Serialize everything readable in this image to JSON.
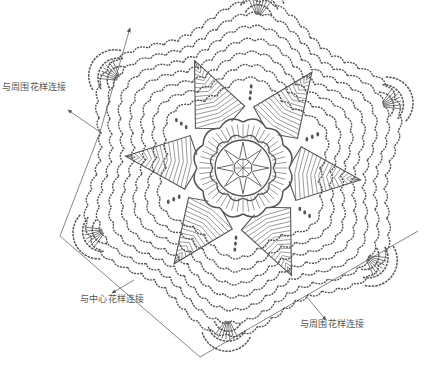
{
  "diagram": {
    "type": "crochet-chart",
    "center": {
      "x": 243,
      "y": 168
    },
    "segments": 6,
    "colors": {
      "stroke": "#555555",
      "line": "#777777",
      "background": "#ffffff"
    }
  },
  "annotations": [
    {
      "id": "top-left",
      "text": "与周围花样连接",
      "x": 2,
      "y": 86,
      "arrow_from": [
        100,
        132
      ],
      "arrow_to": [
        68,
        110
      ]
    },
    {
      "id": "bottom-left",
      "text": "与中心花样连接",
      "x": 80,
      "y": 297,
      "arrow_from": [
        134,
        280
      ],
      "arrow_to": [
        112,
        293
      ]
    },
    {
      "id": "bottom-right",
      "text": "与周围花样连接",
      "x": 300,
      "y": 322,
      "arrow_from": [
        306,
        296
      ],
      "arrow_to": [
        326,
        320
      ]
    }
  ],
  "frame_lines": [
    {
      "from": [
        130,
        28
      ],
      "to": [
        100,
        132
      ],
      "arrow": "start"
    },
    {
      "from": [
        100,
        132
      ],
      "to": [
        60,
        236
      ]
    },
    {
      "from": [
        60,
        236
      ],
      "to": [
        200,
        357
      ]
    },
    {
      "from": [
        200,
        357
      ],
      "to": [
        418,
        231
      ]
    }
  ]
}
